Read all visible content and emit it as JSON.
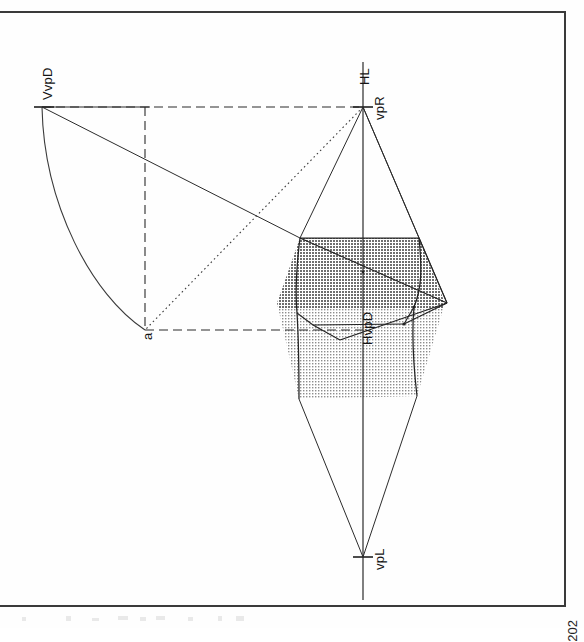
{
  "page": {
    "folio": "202",
    "orientation": "rotated-90-ccw",
    "background_color": "#fefefe",
    "frame_color": "#3a3a3a"
  },
  "figure": {
    "line_color": "#2b2b2b",
    "fill_dark": "#9a9a9a",
    "fill_light": "#d4d4d4",
    "labels": [
      {
        "id": "VvpD",
        "text": "VvpD",
        "x": 40,
        "y": 100,
        "note": "vertical diagonal vanishing point"
      },
      {
        "id": "HL",
        "text": "HL",
        "x": 357,
        "y": 85,
        "note": "horizon line"
      },
      {
        "id": "vpR",
        "text": "vpR",
        "x": 372,
        "y": 120,
        "note": "right vanishing point"
      },
      {
        "id": "a",
        "text": "a",
        "x": 140,
        "y": 340,
        "note": "measuring point a"
      },
      {
        "id": "HvpD",
        "text": "HvpD",
        "x": 360,
        "y": 345,
        "note": "horizontal diagonal vanishing point"
      },
      {
        "id": "vpL",
        "text": "vpL",
        "x": 372,
        "y": 570,
        "note": "left vanishing point"
      }
    ],
    "points": {
      "VvpD": [
        42,
        107
      ],
      "vpR": [
        363,
        107
      ],
      "vpL": [
        363,
        557
      ],
      "a": [
        145,
        330
      ],
      "hl_top": [
        363,
        62
      ],
      "hl_bottom": [
        363,
        600
      ],
      "cube_top_left": [
        300,
        238
      ],
      "cube_top_right": [
        419,
        238
      ],
      "cube_mid_left": [
        297,
        313
      ],
      "cube_mid_right": [
        414,
        307
      ],
      "cube_far_right": [
        447,
        303
      ],
      "cube_bottom_left": [
        299,
        399
      ],
      "cube_bottom_right": [
        417,
        396
      ],
      "cube_inner_left": [
        313,
        325
      ],
      "cube_inner_right": [
        404,
        324
      ]
    },
    "bands": {
      "dark_band": {
        "top": 238,
        "bottom": 308,
        "left": 277,
        "right": 445
      },
      "light_band": {
        "top": 308,
        "bottom": 399,
        "left": 277,
        "right": 445
      }
    },
    "line_styles": {
      "solid": "solid construction line",
      "dashed": "dashed projection rectangle",
      "dotted": "dotted diagonal from vpR to a",
      "arc": "swing arc from VvpD to a"
    }
  }
}
